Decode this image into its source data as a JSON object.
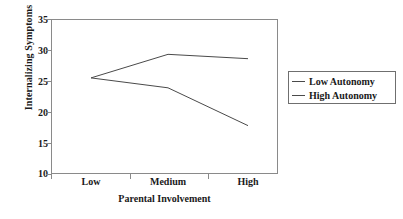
{
  "chart_data": {
    "type": "line",
    "title": "",
    "xlabel": "Parental Involvement",
    "ylabel": "Internalizing Symptoms",
    "categories": [
      "Low",
      "Medium",
      "High"
    ],
    "ylim": [
      10,
      35
    ],
    "yticks": [
      10,
      15,
      20,
      25,
      30,
      35
    ],
    "ytick_labels": [
      "10",
      "15",
      "20",
      "25",
      "30",
      "35"
    ],
    "grid": false,
    "legend_position": "right",
    "series": [
      {
        "name": "Low Autonomy",
        "values": [
          25.5,
          29.3,
          28.6
        ],
        "color": "#4a4a4a"
      },
      {
        "name": "High Autonomy",
        "values": [
          25.5,
          23.9,
          17.8
        ],
        "color": "#4a4a4a"
      }
    ],
    "annotations": []
  },
  "axis": {
    "ytick_0": "10",
    "ytick_1": "15",
    "ytick_2": "20",
    "ytick_3": "25",
    "ytick_4": "30",
    "ytick_5": "35",
    "xtick_0": "Low",
    "xtick_1": "Medium",
    "xtick_2": "High",
    "x_title": "Parental Involvement",
    "y_title": "Internalizing Symptoms"
  },
  "legend": {
    "entries": [
      {
        "label": "Low Autonomy"
      },
      {
        "label": "High Autonomy"
      }
    ]
  }
}
